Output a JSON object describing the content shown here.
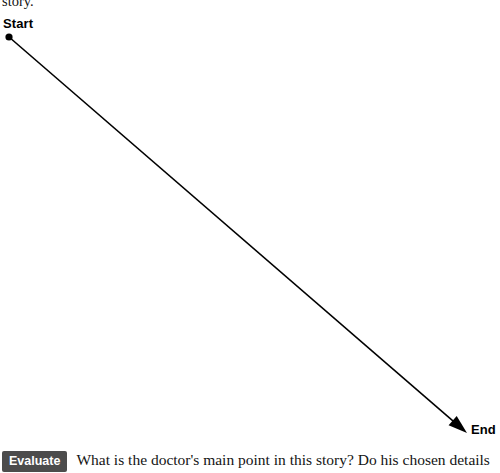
{
  "page": {
    "background_color": "#ffffff",
    "clipped_text_above": "story."
  },
  "diagram": {
    "name": "story-arc-timeline",
    "line_color": "#000000",
    "start": {
      "label": "Start",
      "marker": "filled-dot",
      "x": 9,
      "y": 37
    },
    "end": {
      "label": "End",
      "marker": "arrowhead",
      "x": 467,
      "y": 433
    }
  },
  "prompt": {
    "tag_label": "Evaluate",
    "tag_background": "#4c4c4c",
    "tag_text_color": "#ffffff",
    "question": "What is the doctor's main point in this story? Do his chosen details"
  }
}
